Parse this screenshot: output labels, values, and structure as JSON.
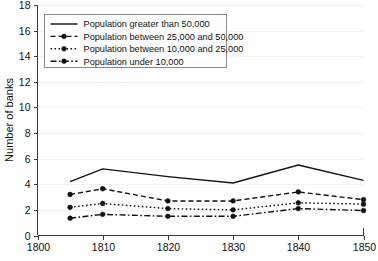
{
  "chart_data": {
    "type": "line",
    "title": "",
    "subtitle": "",
    "xlabel": "",
    "ylabel": "Number of banks",
    "xlim": [
      1800,
      1850
    ],
    "ylim": [
      0,
      18
    ],
    "x": [
      1805,
      1810,
      1820,
      1830,
      1840,
      1850
    ],
    "xticks": [
      "1800",
      "1810",
      "1820",
      "1830",
      "1840",
      "1850"
    ],
    "xtick_values": [
      1800,
      1810,
      1820,
      1830,
      1840,
      1850
    ],
    "yticks": [
      "0",
      "2",
      "4",
      "6",
      "8",
      "10",
      "12",
      "14",
      "16",
      "18"
    ],
    "ytick_values": [
      0,
      2,
      4,
      6,
      8,
      10,
      12,
      14,
      16,
      18
    ],
    "grid": "faint-horizontal",
    "legend_position": "top-left",
    "series": [
      {
        "name": "Population greater than 50,000",
        "values": [
          4.2,
          5.2,
          4.6,
          4.1,
          5.5,
          4.3
        ],
        "style": "solid",
        "marker": "none"
      },
      {
        "name": "Population between 25,000 and 50,000",
        "values": [
          3.2,
          3.65,
          2.7,
          2.7,
          3.4,
          2.8
        ],
        "style": "dashed",
        "marker": "circle"
      },
      {
        "name": "Population between 10,000 and 25,000",
        "values": [
          2.2,
          2.5,
          2.1,
          2.0,
          2.55,
          2.45
        ],
        "style": "dotted",
        "marker": "circle"
      },
      {
        "name": "Population under 10,000",
        "values": [
          1.35,
          1.65,
          1.5,
          1.5,
          2.1,
          1.95
        ],
        "style": "dashdot",
        "marker": "circle"
      }
    ]
  },
  "axis": {
    "y_title": "Number of banks"
  },
  "legend": {
    "entries": [
      "Population greater than 50,000",
      "Population between 25,000 and 50,000",
      "Population between 10,000 and 25,000",
      "Population under 10,000"
    ]
  }
}
